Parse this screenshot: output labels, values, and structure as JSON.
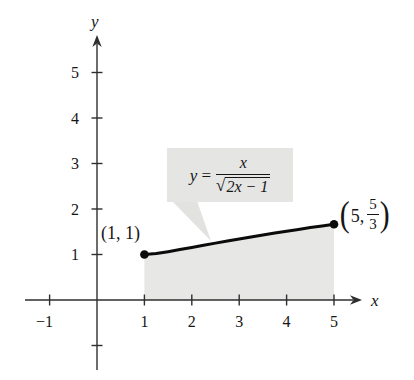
{
  "palette": {
    "background": "#ffffff",
    "axis": "#2e2e2e",
    "text": "#161616",
    "curve": "#0b0b0b",
    "shade": "#e7e7e6",
    "callout_bg": "#e5e5e4"
  },
  "axes": {
    "x_label": "x",
    "y_label": "y",
    "x_ticks": [
      {
        "v": -1,
        "label": "−1"
      },
      {
        "v": 1,
        "label": "1"
      },
      {
        "v": 2,
        "label": "2"
      },
      {
        "v": 3,
        "label": "3"
      },
      {
        "v": 4,
        "label": "4"
      },
      {
        "v": 5,
        "label": "5"
      }
    ],
    "y_ticks": [
      {
        "v": -1,
        "label": ""
      },
      {
        "v": 1,
        "label": "1"
      },
      {
        "v": 2,
        "label": "2"
      },
      {
        "v": 3,
        "label": "3"
      },
      {
        "v": 4,
        "label": "4"
      },
      {
        "v": 5,
        "label": "5"
      }
    ]
  },
  "callout": {
    "lhs_var": "y",
    "eq": "=",
    "numerator": "x",
    "radical_sign": "√",
    "radicand": "2x − 1"
  },
  "point_labels": {
    "p1": "(1, 1)",
    "p2_open": "(",
    "p2_x": "5,",
    "p2_num": "5",
    "p2_den": "3",
    "p2_close": ")"
  },
  "chart_data": {
    "type": "line",
    "title": "",
    "function": "y = x / sqrt(2x − 1)",
    "xlabel": "x",
    "ylabel": "y",
    "xlim": [
      -1.5,
      5.6
    ],
    "ylim": [
      -1.7,
      5.8
    ],
    "grid": false,
    "tick_step": 1,
    "x": [
      1,
      1.25,
      1.5,
      1.75,
      2,
      2.25,
      2.5,
      2.75,
      3,
      3.25,
      3.5,
      3.75,
      4,
      4.25,
      4.5,
      4.75,
      5
    ],
    "y": [
      1.0,
      1.0206,
      1.0607,
      1.1068,
      1.1547,
      1.2027,
      1.25,
      1.2963,
      1.3416,
      1.3859,
      1.4289,
      1.4709,
      1.5119,
      1.5519,
      1.591,
      1.6293,
      1.6667
    ],
    "marked_points": [
      {
        "x": 1,
        "y": 1.0,
        "label": "(1, 1)"
      },
      {
        "x": 5,
        "y": 1.6667,
        "label": "(5, 5/3)"
      }
    ],
    "shaded_region": {
      "from_x": 1,
      "to_x": 5,
      "lower": "y = 0 (x-axis)",
      "upper": "curve"
    }
  }
}
